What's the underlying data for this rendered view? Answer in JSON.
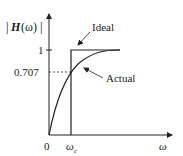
{
  "diagram": {
    "type": "lowpass-filter-response",
    "y_axis_label": "|H(ω)|",
    "y_label_main": "H",
    "y_label_arg": "(ω)",
    "x_axis_label": "ω",
    "origin_label": "0",
    "x_tick_label_main": "ω",
    "x_tick_label_sub": "c",
    "y_ticks": [
      "1",
      "0.707"
    ],
    "curves": [
      {
        "name": "Ideal",
        "label": "Ideal"
      },
      {
        "name": "Actual",
        "label": "Actual"
      }
    ]
  },
  "colors": {
    "line": "#222222",
    "background": "#ffffff"
  }
}
